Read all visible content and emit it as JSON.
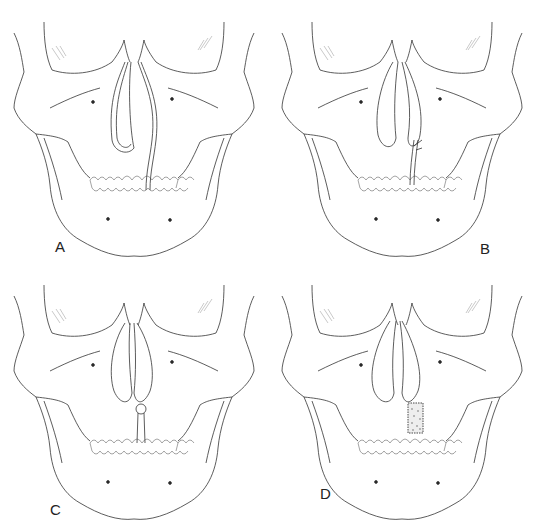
{
  "figure": {
    "panels": [
      {
        "id": "A",
        "label": "A",
        "description": "Skull with nasal tube loops, tube exiting between upper central incisors",
        "stage": "tube-in-place"
      },
      {
        "id": "B",
        "label": "B",
        "description": "Tube loop with small side branch near upper incisors",
        "stage": "tube-with-branch"
      },
      {
        "id": "C",
        "label": "C",
        "description": "Loops joined with a knotted connection above incisors",
        "stage": "tube-tied"
      },
      {
        "id": "D",
        "label": "D",
        "description": "Loops with stippled dressing/splint block over upper incisor region",
        "stage": "dressing-applied"
      }
    ]
  },
  "colors": {
    "line": "#333333",
    "hatch": "#cfcfcf",
    "background": "#ffffff"
  }
}
